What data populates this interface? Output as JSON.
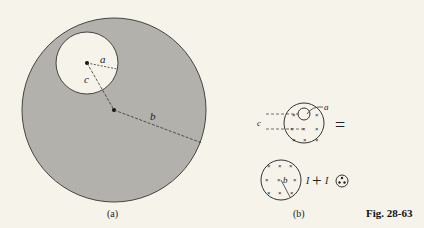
{
  "figure": {
    "caption": "Fig. 28-63",
    "colors": {
      "background": "#f6f3ea",
      "shaded": "#b3b1ab",
      "line": "#333333"
    }
  },
  "panel_a": {
    "label": "(a)",
    "labels": {
      "a": "a",
      "b": "b",
      "c": "c"
    }
  },
  "panel_b": {
    "label": "(b)",
    "top": {
      "label_a": "a",
      "label_c": "c",
      "equals": "="
    },
    "bottom": {
      "label_b": "b",
      "current_1": "I",
      "plus": "+",
      "current_2": "I"
    }
  }
}
